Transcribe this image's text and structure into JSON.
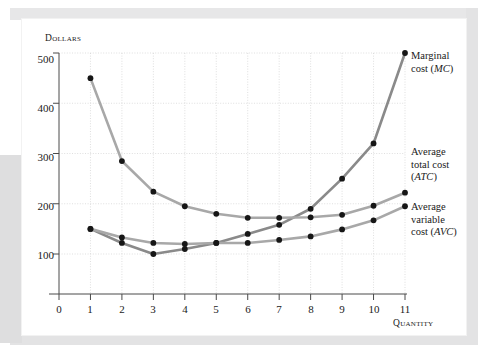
{
  "figure": {
    "background_color": "#ffffff",
    "card_color": "#ffffff",
    "band_color": "#dededf"
  },
  "axes": {
    "y_title": "Dollars",
    "x_title": "Quantity",
    "y_ticks": [
      "100",
      "200",
      "300",
      "400",
      "500"
    ],
    "x_ticks": [
      "0",
      "1",
      "2",
      "3",
      "4",
      "5",
      "6",
      "7",
      "8",
      "9",
      "10",
      "11"
    ]
  },
  "annotations": {
    "mc": {
      "line1": "Marginal",
      "line2": "cost (",
      "abbr": "MC",
      "line2_end": ")"
    },
    "atc": {
      "line1": "Average",
      "line2": "total cost",
      "line3_open": "(",
      "abbr": "ATC",
      "line3_close": ")"
    },
    "avc": {
      "line1": "Average",
      "line2": "variable",
      "line3": "cost (",
      "abbr": "AVC",
      "line3_end": ")"
    }
  },
  "chart_data": {
    "type": "line",
    "title": "",
    "xlabel": "Quantity",
    "ylabel": "Dollars",
    "xlim": [
      0,
      11
    ],
    "ylim": [
      0,
      500
    ],
    "grid": true,
    "legend_position": "right-annotations",
    "x": [
      1,
      2,
      3,
      4,
      5,
      6,
      7,
      8,
      9,
      10,
      11
    ],
    "series": [
      {
        "name": "Marginal cost (MC)",
        "abbr": "MC",
        "color": "#8a8a8a",
        "marker_color": "#161616",
        "values": [
          150,
          122,
          100,
          110,
          122,
          140,
          158,
          190,
          250,
          320,
          500
        ]
      },
      {
        "name": "Average total cost (ATC)",
        "abbr": "ATC",
        "color": "#a8a8a8",
        "marker_color": "#161616",
        "values": [
          450,
          285,
          224,
          195,
          180,
          172,
          172,
          173,
          178,
          196,
          222
        ]
      },
      {
        "name": "Average variable cost (AVC)",
        "abbr": "AVC",
        "color": "#a8a8a8",
        "marker_color": "#161616",
        "values": [
          150,
          133,
          122,
          120,
          122,
          122,
          128,
          135,
          149,
          167,
          195
        ]
      }
    ]
  }
}
